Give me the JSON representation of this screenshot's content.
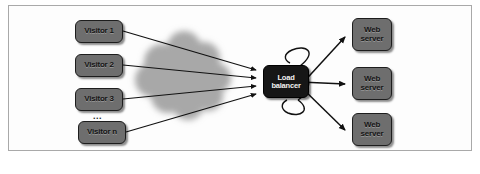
{
  "figure": {
    "background_color": "#ffffff",
    "frame_color": "#a9a9a9",
    "cloud_color": "#a8a8a8",
    "node_fill": "#6e6e6e",
    "node_stroke": "#1d1d1d",
    "balancer_fill": "#161616",
    "balancer_text_color": "#f2f2f2",
    "arrow_color": "#111111"
  },
  "clients": {
    "group_label": "visitors",
    "ellipsis": "...",
    "items": [
      {
        "label": "Visitor 1",
        "x": 75,
        "y": 20
      },
      {
        "label": "Visitor 2",
        "x": 75,
        "y": 54
      },
      {
        "label": "Visitor 3",
        "x": 75,
        "y": 88
      },
      {
        "label": "Visitor n",
        "x": 78,
        "y": 121
      }
    ]
  },
  "balancer": {
    "line1": "Load",
    "line2": "balancer",
    "x": 263,
    "y": 65
  },
  "servers": {
    "items": [
      {
        "line1": "Web",
        "line2": "server",
        "x": 352,
        "y": 18
      },
      {
        "line1": "Web",
        "line2": "server",
        "x": 352,
        "y": 67
      },
      {
        "line1": "Web",
        "line2": "server",
        "x": 352,
        "y": 113
      }
    ]
  },
  "cloud": {
    "label": "network cloud",
    "cx": 186,
    "cy": 76
  },
  "connections": {
    "inbound_count": 4,
    "outbound_count": 3,
    "has_self_loop": true
  }
}
